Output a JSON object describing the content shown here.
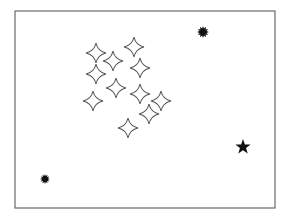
{
  "frame": {
    "x": 15,
    "y": 11,
    "width": 260,
    "height": 197,
    "stroke": "#6a6a6a"
  },
  "sparkles": {
    "stroke": "#555555",
    "fill": "#ffffff",
    "size": 10,
    "points": [
      {
        "x": 96,
        "y": 53
      },
      {
        "x": 134,
        "y": 47
      },
      {
        "x": 113,
        "y": 61
      },
      {
        "x": 140,
        "y": 68
      },
      {
        "x": 96,
        "y": 74
      },
      {
        "x": 116,
        "y": 88
      },
      {
        "x": 140,
        "y": 94
      },
      {
        "x": 93,
        "y": 101
      },
      {
        "x": 161,
        "y": 101
      },
      {
        "x": 149,
        "y": 114
      },
      {
        "x": 128,
        "y": 128
      }
    ]
  },
  "splats": {
    "fill": "#111111",
    "items": [
      {
        "x": 203,
        "y": 32,
        "r": 6
      },
      {
        "x": 45,
        "y": 179,
        "r": 5
      }
    ]
  },
  "solid_star": {
    "x": 243,
    "y": 147,
    "r": 8,
    "fill": "#111111"
  }
}
